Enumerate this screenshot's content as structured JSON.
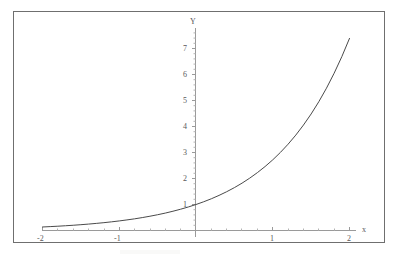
{
  "figure": {
    "border_color": "#6f6f6f",
    "background": "#ffffff"
  },
  "chart_data": {
    "type": "line",
    "title": "",
    "subtitle": "",
    "xlabel": "x",
    "ylabel": "Y",
    "function": "y = e^x",
    "grid": false,
    "legend": null,
    "axis_color": "#9a9a9a",
    "curve_color": "#4a4a4a",
    "xlim": [
      -2.12,
      2.3
    ],
    "ylim": [
      -0.35,
      7.85
    ],
    "xticks": [
      -2,
      -1,
      1,
      2
    ],
    "xtick_labels": [
      "-2",
      "-1",
      "1",
      "2"
    ],
    "yticks": [
      1,
      2,
      3,
      4,
      5,
      6,
      7
    ],
    "ytick_labels": [
      "1",
      "2",
      "3",
      "4",
      "5",
      "6",
      "7"
    ],
    "minor_ticks_per_interval": 4,
    "series": [
      {
        "name": "exp",
        "x": [
          -2.0,
          -1.9,
          -1.8,
          -1.7,
          -1.6,
          -1.5,
          -1.4,
          -1.3,
          -1.2,
          -1.1,
          -1.0,
          -0.9,
          -0.8,
          -0.7,
          -0.6,
          -0.5,
          -0.4,
          -0.3,
          -0.2,
          -0.1,
          0.0,
          0.1,
          0.2,
          0.3,
          0.4,
          0.5,
          0.6,
          0.7,
          0.8,
          0.9,
          1.0,
          1.1,
          1.2,
          1.3,
          1.4,
          1.5,
          1.6,
          1.7,
          1.8,
          1.9,
          2.0
        ],
        "values": [
          0.135,
          0.15,
          0.165,
          0.183,
          0.202,
          0.223,
          0.247,
          0.273,
          0.301,
          0.333,
          0.368,
          0.407,
          0.449,
          0.497,
          0.549,
          0.607,
          0.67,
          0.741,
          0.819,
          0.905,
          1.0,
          1.105,
          1.221,
          1.35,
          1.492,
          1.649,
          1.822,
          2.014,
          2.226,
          2.46,
          2.718,
          3.004,
          3.32,
          3.669,
          4.055,
          4.482,
          4.953,
          5.474,
          6.05,
          6.686,
          7.389
        ]
      }
    ]
  },
  "labels": {
    "y_axis_title": "Y",
    "x_axis_title": "x",
    "y": {
      "t7": "7",
      "t6": "6",
      "t5": "5",
      "t4": "4",
      "t3": "3",
      "t2": "2",
      "t1": "1"
    },
    "x": {
      "tm2": "-2",
      "tm1": "-1",
      "t1": "1",
      "t2": "2"
    }
  }
}
